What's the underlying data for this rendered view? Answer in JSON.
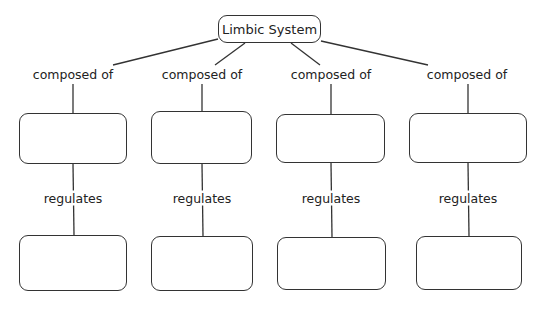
{
  "root": {
    "label": "Limbic System",
    "box": [
      218,
      15,
      103,
      28
    ]
  },
  "branches": [
    {
      "link_label": "composed of",
      "link_label_pos": [
        73,
        74
      ],
      "mid_box": [
        19,
        113,
        108,
        51
      ],
      "mid_text": "",
      "sub_link_label": "regulates",
      "sub_link_label_pos": [
        73,
        198
      ],
      "bottom_box": [
        19,
        235,
        108,
        56
      ],
      "bottom_text": ""
    },
    {
      "link_label": "composed of",
      "link_label_pos": [
        202,
        74
      ],
      "mid_box": [
        151,
        111,
        101,
        53
      ],
      "mid_text": "",
      "sub_link_label": "regulates",
      "sub_link_label_pos": [
        202,
        198
      ],
      "bottom_box": [
        151,
        236,
        102,
        55
      ],
      "bottom_text": ""
    },
    {
      "link_label": "composed of",
      "link_label_pos": [
        331,
        74
      ],
      "mid_box": [
        276,
        114,
        109,
        49
      ],
      "mid_text": "",
      "sub_link_label": "regulates",
      "sub_link_label_pos": [
        331,
        198
      ],
      "bottom_box": [
        277,
        237,
        109,
        53
      ],
      "bottom_text": ""
    },
    {
      "link_label": "composed of",
      "link_label_pos": [
        467,
        74
      ],
      "mid_box": [
        409,
        113,
        118,
        50
      ],
      "mid_text": "",
      "sub_link_label": "regulates",
      "sub_link_label_pos": [
        468,
        198
      ],
      "bottom_box": [
        416,
        236,
        106,
        54
      ],
      "bottom_text": ""
    }
  ],
  "colors": {
    "line": "#333333",
    "background": "#ffffff",
    "text": "#222222"
  }
}
